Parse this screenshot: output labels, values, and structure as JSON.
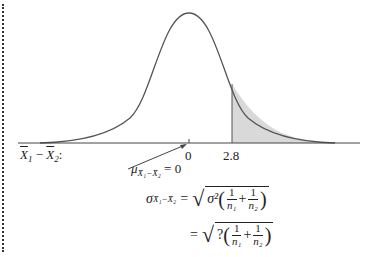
{
  "diagram": {
    "type": "normal-distribution-sampling",
    "axis_variable": "X̄₁ − X̄₂:",
    "axis_variable_parts": {
      "x1": "X",
      "sub1": "1",
      "minus": " − ",
      "x2": "X",
      "sub2": "2",
      "colon": ":"
    },
    "ticks": [
      {
        "label": "0",
        "value": 0
      },
      {
        "label": "2.8",
        "value": 2.8
      }
    ],
    "shaded_region": {
      "from": 2.8,
      "to": "right tail",
      "color": "#d9d9d9"
    },
    "mean_annotation": {
      "symbol": "μ",
      "subscript": "X̄₁−X̄₂",
      "equals": "= 0"
    },
    "std_formula_line1": {
      "lhs_symbol": "σ",
      "lhs_subscript": "X̄₁−X̄₂",
      "equals": "=",
      "inner_lead": "σ²",
      "frac1_num": "1",
      "frac1_den": "n₁",
      "plus": "+",
      "frac2_num": "1",
      "frac2_den": "n₂"
    },
    "std_formula_line2": {
      "equals": "=",
      "inner_lead": "?",
      "frac1_num": "1",
      "frac1_den": "n₁",
      "plus": "+",
      "frac2_num": "1",
      "frac2_den": "n₂"
    },
    "colors": {
      "curve": "#555555",
      "axis": "#444444",
      "shade": "#d9d9d9",
      "dotted_border": "#333333"
    }
  }
}
